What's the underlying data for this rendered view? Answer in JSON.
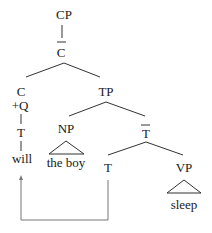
{
  "tree": {
    "nodes": {
      "cp": "CP",
      "cbar": "C",
      "c": "C",
      "plus_q": "+Q",
      "t_left": "T",
      "will": "will",
      "tp": "TP",
      "np": "NP",
      "the_boy": "the boy",
      "tbar": "T",
      "t_head": "T",
      "vp": "VP",
      "sleep": "sleep"
    },
    "bar_nodes": [
      "cbar",
      "tbar"
    ],
    "movement": {
      "from": "t_head",
      "to": "will",
      "label": "T-to-C movement"
    }
  }
}
